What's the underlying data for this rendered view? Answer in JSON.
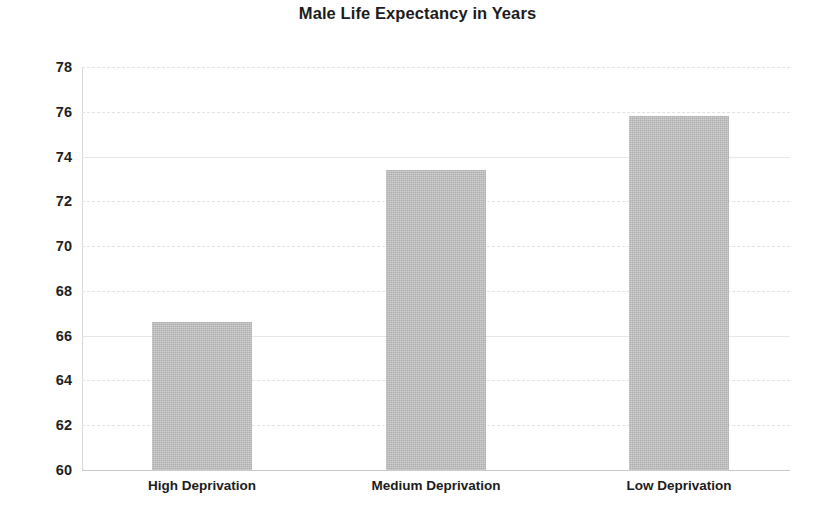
{
  "chart_data": {
    "type": "bar",
    "title": "Male Life Expectancy in Years",
    "xlabel": "",
    "ylabel": "",
    "categories": [
      "High Deprivation",
      "Medium Deprivation",
      "Low Deprivation"
    ],
    "values": [
      66.6,
      73.4,
      75.8
    ],
    "ylim": [
      60,
      78
    ],
    "yticks": [
      60,
      62,
      64,
      66,
      68,
      70,
      72,
      74,
      76,
      78
    ],
    "ytick_labels": [
      "60",
      "62",
      "64",
      "66",
      "68",
      "70",
      "72",
      "74",
      "76",
      "78"
    ],
    "grid": true,
    "grid_axis": "y",
    "legend": false,
    "bar_color": "#bdbdbd",
    "title_color": "#1c1c1c",
    "grid_color": "#e2e2e2",
    "axis_color": "#c9c9c9",
    "background_color": "#ffffff",
    "bar_width_px": 100,
    "bar_centers_px": [
      202,
      436,
      679
    ]
  }
}
